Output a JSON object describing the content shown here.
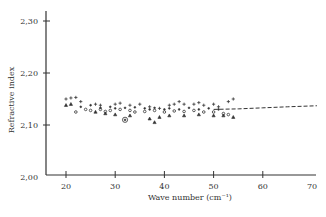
{
  "chart_data": {
    "type": "scatter",
    "title": "",
    "xlabel": "Wave number (cm⁻¹)",
    "ylabel": "Refractive index",
    "xlim": [
      16,
      70
    ],
    "ylim": [
      2.0,
      2.33
    ],
    "x_ticks": [
      "20",
      "30",
      "40",
      "50",
      "60",
      "70"
    ],
    "y_ticks": [
      "2,00",
      "2,10",
      "2,20",
      "2,30"
    ],
    "grid": false,
    "legend": null,
    "series": [
      {
        "name": "crosses (+)",
        "marker": "plus",
        "points": [
          [
            20,
            2.15
          ],
          [
            21,
            2.152
          ],
          [
            22,
            2.153
          ],
          [
            23,
            2.145
          ],
          [
            26,
            2.14
          ],
          [
            27,
            2.138
          ],
          [
            30,
            2.14
          ],
          [
            31,
            2.142
          ],
          [
            33,
            2.138
          ],
          [
            35,
            2.14
          ],
          [
            37,
            2.135
          ],
          [
            39,
            2.132
          ],
          [
            41,
            2.138
          ],
          [
            42,
            2.14
          ],
          [
            43,
            2.145
          ],
          [
            44,
            2.14
          ],
          [
            46,
            2.14
          ],
          [
            47,
            2.143
          ],
          [
            48,
            2.138
          ],
          [
            50,
            2.14
          ],
          [
            51,
            2.135
          ],
          [
            53,
            2.145
          ],
          [
            54,
            2.15
          ]
        ]
      },
      {
        "name": "circles (o)",
        "marker": "circle",
        "points": [
          [
            22,
            2.125
          ],
          [
            24,
            2.13
          ],
          [
            25,
            2.128
          ],
          [
            27,
            2.13
          ],
          [
            28,
            2.126
          ],
          [
            29,
            2.128
          ],
          [
            31,
            2.13
          ],
          [
            33,
            2.128
          ],
          [
            34,
            2.125
          ],
          [
            36,
            2.126
          ],
          [
            38,
            2.128
          ],
          [
            40,
            2.125
          ],
          [
            42,
            2.127
          ],
          [
            44,
            2.126
          ],
          [
            46,
            2.128
          ],
          [
            48,
            2.125
          ],
          [
            50,
            2.125
          ],
          [
            52,
            2.122
          ],
          [
            53,
            2.12
          ]
        ]
      },
      {
        "name": "dots (·)",
        "marker": "dot",
        "points": [
          [
            23,
            2.135
          ],
          [
            25,
            2.138
          ],
          [
            27,
            2.133
          ],
          [
            29,
            2.135
          ],
          [
            30,
            2.132
          ],
          [
            32,
            2.133
          ],
          [
            34,
            2.134
          ],
          [
            36,
            2.132
          ],
          [
            37,
            2.13
          ],
          [
            38,
            2.133
          ],
          [
            40,
            2.13
          ],
          [
            41,
            2.132
          ],
          [
            43,
            2.13
          ],
          [
            45,
            2.133
          ],
          [
            47,
            2.13
          ],
          [
            49,
            2.132
          ],
          [
            51,
            2.13
          ]
        ]
      },
      {
        "name": "triangles (△)",
        "marker": "triangle",
        "points": [
          [
            20,
            2.138
          ],
          [
            21,
            2.14
          ],
          [
            26,
            2.125
          ],
          [
            28,
            2.122
          ],
          [
            30,
            2.12
          ],
          [
            33,
            2.118
          ],
          [
            37,
            2.112
          ],
          [
            38,
            2.105
          ],
          [
            39,
            2.115
          ],
          [
            41,
            2.118
          ],
          [
            44,
            2.118
          ],
          [
            47,
            2.12
          ],
          [
            50,
            2.118
          ],
          [
            52,
            2.118
          ],
          [
            54,
            2.115
          ]
        ]
      },
      {
        "name": "circled dot (⊙)",
        "marker": "circled-dot",
        "points": [
          [
            32,
            2.11
          ]
        ]
      },
      {
        "name": "dashed trend",
        "marker": "dashed-line",
        "points": [
          [
            50,
            2.13
          ],
          [
            55,
            2.131
          ],
          [
            60,
            2.133
          ],
          [
            65,
            2.135
          ],
          [
            71,
            2.137
          ]
        ]
      }
    ]
  }
}
